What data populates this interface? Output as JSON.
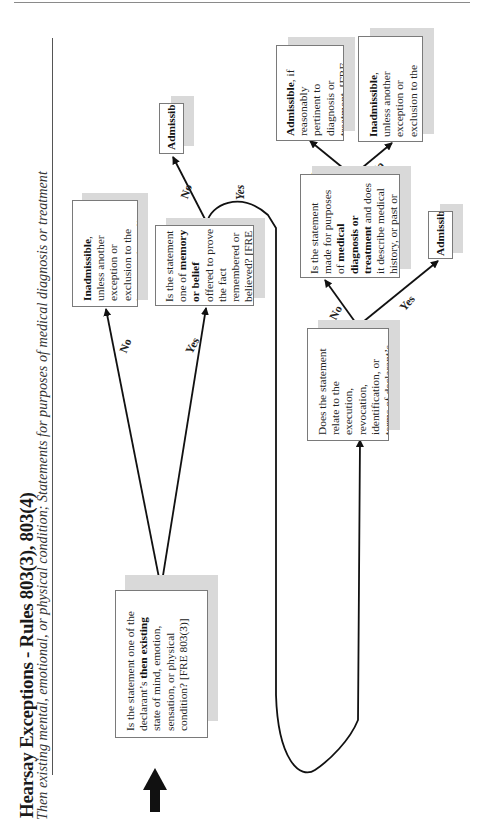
{
  "header": {
    "title": "Hearsay Exceptions - Rules 803(3), 803(4)",
    "subtitle": "Then existing mental, emotional, or physical condition; Statements for purposes of medical diagnosis or treatment"
  },
  "nodes": {
    "q_then_existing": {
      "pre": "Is the statement one of the declarant’s ",
      "bold": "then existing",
      "post": " state of mind, emotion, sensation, or physical condition? [FRE 803(3)]"
    },
    "out_inadmissible_1": {
      "bold": "Inadmissible",
      "post": ", unless another exception or exclusion to the hearsay rule applies."
    },
    "q_memory_belief": {
      "pre": "Is the statement one of ",
      "bold": "memory or belief",
      "post": " offered to prove the fact remembered or believed? [FRE 803(3)]"
    },
    "out_admissible_1": {
      "bold": "Admissible."
    },
    "q_will": {
      "pre": "Does the statement relate to the execution, revocation, identification, or terms of declarant’s ",
      "bold": "will",
      "post": "? [FRE 803(3)]"
    },
    "out_admissible_2": {
      "bold": "Admissible."
    },
    "q_medical": {
      "pre": "Is the statement made for purposes of ",
      "bold": "medical diagnosis or treatment",
      "post": " and does it describe medical history, or past or present symptoms, pain, or sensations? [FRE 803(4)]"
    },
    "out_admissible_3": {
      "bold": "Admissible",
      "post": ", if reasonably pertinent to diagnosis or treatment. [FRE 803(4)]"
    },
    "out_inadmissible_2": {
      "bold": "Inadmissible",
      "post": ", unless another exception or exclusion to the hearsay rule applies."
    }
  },
  "edges": {
    "then_existing_no": "No",
    "then_existing_yes": "Yes",
    "memory_no": "No",
    "memory_yes": "Yes",
    "will_no": "No",
    "will_yes": "Yes",
    "medical_yes": "Yes",
    "medical_no": "No"
  },
  "colors": {
    "shadow": "#d9d9d9",
    "border": "#7a7a7a",
    "line": "#111111"
  }
}
